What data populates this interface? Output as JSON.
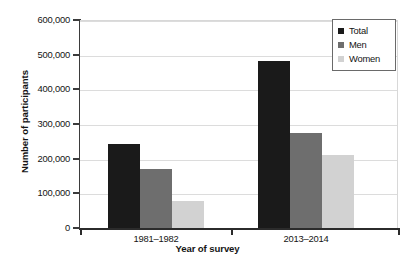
{
  "chart_data": {
    "type": "bar",
    "title": "",
    "subtitle": "",
    "xlabel": "Year of survey",
    "ylabel": "Number of participants",
    "categories": [
      "1981–1982",
      "2013–2014"
    ],
    "series": [
      {
        "name": "Total",
        "color": "#1a1a1a",
        "values": [
          243000,
          482000
        ]
      },
      {
        "name": "Men",
        "color": "#6e6e6e",
        "values": [
          170000,
          275000
        ]
      },
      {
        "name": "Women",
        "color": "#d2d2d2",
        "values": [
          77000,
          212000
        ]
      }
    ],
    "ylim": [
      0,
      600000
    ],
    "ytick_values": [
      0,
      100000,
      200000,
      300000,
      400000,
      500000,
      600000
    ],
    "ytick_labels": [
      "0",
      "100,000",
      "200,000",
      "300,000",
      "400,000",
      "500,000",
      "600,000"
    ],
    "grid": true,
    "grid_axis": "y",
    "legend_position": "top-right",
    "legend_entries": [
      "Total",
      "Men",
      "Women"
    ],
    "legend_marker": "square",
    "background_color": "#ffffff",
    "gridline_color": "#dcdcdc",
    "axis_color": "#2b2b2b"
  }
}
